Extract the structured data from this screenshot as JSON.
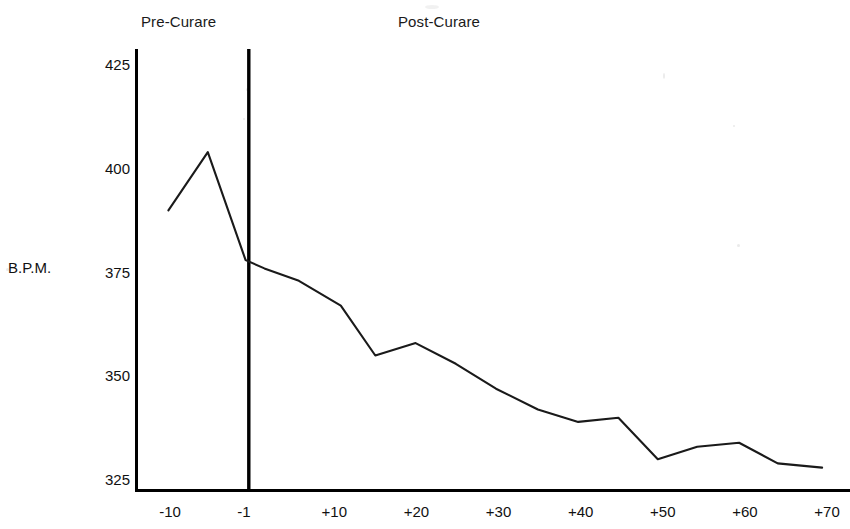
{
  "chart_data": {
    "type": "line",
    "title": "",
    "xlabel": "",
    "ylabel": "B.P.M.",
    "xlim": [
      -12,
      70
    ],
    "ylim": [
      316,
      435
    ],
    "grid": false,
    "legend_position": "none",
    "x_tick_labels": [
      "-10",
      "-1",
      "+10",
      "+20",
      "+30",
      "+40",
      "+50",
      "+60",
      "+70"
    ],
    "x_tick_values": [
      -10,
      -1,
      10,
      20,
      30,
      40,
      50,
      60,
      70
    ],
    "y_tick_labels": [
      "425",
      "400",
      "375",
      "350",
      "325"
    ],
    "y_tick_values": [
      425,
      400,
      375,
      350,
      325
    ],
    "annotations": [
      {
        "name": "pre-curare",
        "text": "Pre-Curare"
      },
      {
        "name": "post-curare",
        "text": "Post-Curare"
      }
    ],
    "divider_x_value": -0.4,
    "series": [
      {
        "name": "Heart rate",
        "x": [
          -10.2,
          -5.4,
          -0.8,
          1.5,
          5.7,
          10.8,
          15.0,
          19.9,
          24.8,
          29.7,
          34.8,
          39.7,
          44.6,
          49.4,
          54.2,
          59.3,
          64.0,
          69.4
        ],
        "values": [
          390,
          404,
          378,
          376,
          373,
          367,
          355,
          358,
          353,
          347,
          342,
          339,
          340,
          330,
          333,
          334,
          329,
          328
        ]
      }
    ]
  },
  "chart": {
    "phase_pre_label": "Pre-Curare",
    "phase_post_label": "Post-Curare",
    "y_axis_caption": "B.P.M.",
    "colors": {
      "line": "#1a1a1a",
      "axis": "#000000",
      "background": "#ffffff",
      "text": "#111111"
    }
  }
}
